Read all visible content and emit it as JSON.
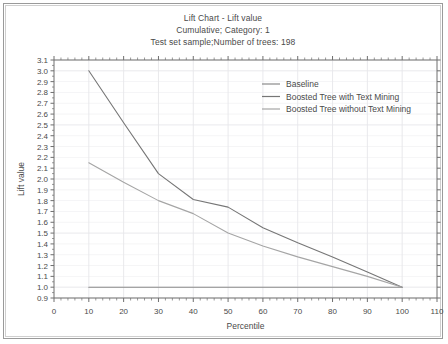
{
  "chart_data": {
    "type": "line",
    "title": "Lift Chart - Lift value",
    "subtitle": "Cumulative; Category: 1",
    "subtitle2": "Test set sample;Number of trees: 198",
    "xlabel": "Percentile",
    "ylabel": "Lift value",
    "xlim": [
      0,
      110
    ],
    "ylim": [
      0.9,
      3.1
    ],
    "xticks": [
      0,
      10,
      20,
      30,
      40,
      50,
      60,
      70,
      80,
      90,
      100,
      110
    ],
    "yticks": [
      0.9,
      1.0,
      1.1,
      1.2,
      1.3,
      1.4,
      1.5,
      1.6,
      1.7,
      1.8,
      1.9,
      2.0,
      2.1,
      2.2,
      2.3,
      2.4,
      2.5,
      2.6,
      2.7,
      2.8,
      2.9,
      3.0,
      3.1
    ],
    "grid": true,
    "legend_position": "top-right",
    "x": [
      10,
      20,
      30,
      40,
      50,
      60,
      70,
      80,
      90,
      100
    ],
    "series": [
      {
        "name": "Baseline",
        "color": "#8a8a8a",
        "values": [
          1.0,
          1.0,
          1.0,
          1.0,
          1.0,
          1.0,
          1.0,
          1.0,
          1.0,
          1.0
        ]
      },
      {
        "name": "Boosted Tree with Text Mining",
        "color": "#767676",
        "values": [
          3.0,
          2.52,
          2.05,
          1.81,
          1.74,
          1.55,
          1.41,
          1.28,
          1.14,
          1.0
        ]
      },
      {
        "name": "Boosted Tree without Text Mining",
        "color": "#a5a5a5",
        "values": [
          2.15,
          1.97,
          1.8,
          1.68,
          1.5,
          1.38,
          1.28,
          1.19,
          1.1,
          1.0
        ]
      }
    ]
  },
  "colors": {
    "axis": "#6e6e6e",
    "grid": "#e6e6ea",
    "frame_outer": "#9a9a9a",
    "frame_inner": "#cfcfcf",
    "text": "#4a4a4a"
  }
}
